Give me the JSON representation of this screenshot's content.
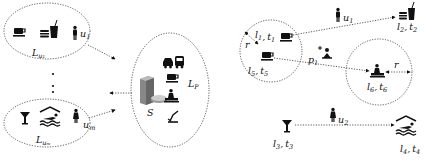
{
  "left_panel": {
    "user_groups": [
      {
        "id": "u1",
        "label": "L",
        "label_sub": "u₁",
        "user_label": "u",
        "user_sub": "1",
        "icons": [
          "coffee-cup-icon",
          "burger-drink-icon",
          "person-icon"
        ]
      },
      {
        "id": "um",
        "label": "L",
        "label_sub": "uₘ",
        "user_label": "u",
        "user_sub": "m",
        "icons": [
          "cocktail-icon",
          "swimming-pool-icon",
          "person-icon"
        ]
      }
    ],
    "ellipsis": "⋮",
    "server": {
      "label": "S",
      "location_set_label": "L",
      "location_set_sub": "P",
      "icons": [
        "server-database-icon",
        "vehicles-icon",
        "coffee-cup-icon",
        "spa-massage-icon",
        "ski-icon"
      ]
    }
  },
  "right_panel": {
    "nodes": [
      {
        "id": "l1t1",
        "l": "l",
        "l_sub": "1",
        "t": "t",
        "t_sub": "1",
        "icon": "coffee-cup-icon"
      },
      {
        "id": "l2t2",
        "l": "l",
        "l_sub": "2",
        "t": "t",
        "t_sub": "2",
        "icon": "burger-drink-icon"
      },
      {
        "id": "l3t3",
        "l": "l",
        "l_sub": "3",
        "t": "t",
        "t_sub": "3",
        "icon": "cocktail-icon"
      },
      {
        "id": "l4t4",
        "l": "l",
        "l_sub": "4",
        "t": "t",
        "t_sub": "4",
        "icon": "swimming-pool-icon"
      },
      {
        "id": "l5t5",
        "l": "l",
        "l_sub": "5",
        "t": "t",
        "t_sub": "5",
        "icon": "coffee-cup-icon"
      },
      {
        "id": "l6t6",
        "l": "l",
        "l_sub": "6",
        "t": "t",
        "t_sub": "6",
        "icon": "spa-massage-icon"
      }
    ],
    "users": [
      {
        "label": "u",
        "sub": "1"
      },
      {
        "label": "u",
        "sub": "2"
      }
    ],
    "poi": {
      "label": "p",
      "sub": "1"
    },
    "radius_label": "r",
    "separator": ","
  }
}
